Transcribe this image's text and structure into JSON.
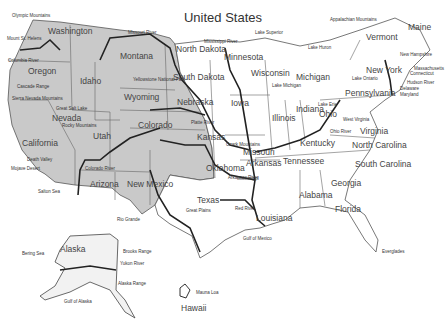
{
  "title": "United States",
  "colors": {
    "west_fill": "#c9c9c9",
    "east_fill": "#ffffff",
    "border": "#555555",
    "river": "#222222"
  },
  "states": [
    {
      "name": "Washington",
      "x": 48,
      "y": 34
    },
    {
      "name": "Oregon",
      "x": 28,
      "y": 74
    },
    {
      "name": "Idaho",
      "x": 80,
      "y": 84
    },
    {
      "name": "Montana",
      "x": 120,
      "y": 59
    },
    {
      "name": "Wyoming",
      "x": 124,
      "y": 100
    },
    {
      "name": "California",
      "x": 22,
      "y": 146
    },
    {
      "name": "Nevada",
      "x": 52,
      "y": 121
    },
    {
      "name": "Utah",
      "x": 93,
      "y": 139
    },
    {
      "name": "Colorado",
      "x": 138,
      "y": 128
    },
    {
      "name": "Arizona",
      "x": 90,
      "y": 187
    },
    {
      "name": "New Mexico",
      "x": 127,
      "y": 187
    },
    {
      "name": "North Dakota",
      "x": 176,
      "y": 52
    },
    {
      "name": "South Dakota",
      "x": 173,
      "y": 80
    },
    {
      "name": "Nebraska",
      "x": 177,
      "y": 105
    },
    {
      "name": "Kansas",
      "x": 197,
      "y": 140
    },
    {
      "name": "Oklahoma",
      "x": 206,
      "y": 171
    },
    {
      "name": "Texas",
      "x": 197,
      "y": 203
    },
    {
      "name": "Minnesota",
      "x": 224,
      "y": 60
    },
    {
      "name": "Iowa",
      "x": 231,
      "y": 106
    },
    {
      "name": "Missouri",
      "x": 243,
      "y": 155
    },
    {
      "name": "Arkansas",
      "x": 246,
      "y": 166
    },
    {
      "name": "Louisiana",
      "x": 256,
      "y": 221
    },
    {
      "name": "Wisconsin",
      "x": 251,
      "y": 76
    },
    {
      "name": "Illinois",
      "x": 272,
      "y": 121
    },
    {
      "name": "Michigan",
      "x": 296,
      "y": 80
    },
    {
      "name": "Indiana",
      "x": 296,
      "y": 112
    },
    {
      "name": "Ohio",
      "x": 319,
      "y": 117
    },
    {
      "name": "Kentucky",
      "x": 300,
      "y": 146
    },
    {
      "name": "Tennessee",
      "x": 283,
      "y": 164
    },
    {
      "name": "Alabama",
      "x": 299,
      "y": 198
    },
    {
      "name": "Georgia",
      "x": 331,
      "y": 186
    },
    {
      "name": "Florida",
      "x": 335,
      "y": 212
    },
    {
      "name": "South Carolina",
      "x": 355,
      "y": 167
    },
    {
      "name": "North Carolina",
      "x": 352,
      "y": 148
    },
    {
      "name": "Virginia",
      "x": 360,
      "y": 134
    },
    {
      "name": "Pennsylvania",
      "x": 345,
      "y": 96
    },
    {
      "name": "New York",
      "x": 366,
      "y": 73
    },
    {
      "name": "Vermont",
      "x": 366,
      "y": 40
    },
    {
      "name": "Maine",
      "x": 408,
      "y": 30
    },
    {
      "name": "Alaska",
      "x": 60,
      "y": 252
    },
    {
      "name": "Hawaii",
      "x": 181,
      "y": 311
    }
  ],
  "features": [
    {
      "name": "Olympic Mountains",
      "x": 12,
      "y": 17
    },
    {
      "name": "Mount St. Helens",
      "x": 7,
      "y": 40
    },
    {
      "name": "Columbia River",
      "x": 8,
      "y": 62
    },
    {
      "name": "Cascade Range",
      "x": 17,
      "y": 88
    },
    {
      "name": "Sierra Nevada Mountains",
      "x": 12,
      "y": 100
    },
    {
      "name": "Great Salt Lake",
      "x": 56,
      "y": 110
    },
    {
      "name": "Rocky Mountains",
      "x": 62,
      "y": 127
    },
    {
      "name": "Death Valley",
      "x": 27,
      "y": 161
    },
    {
      "name": "Mojave Desert",
      "x": 11,
      "y": 170
    },
    {
      "name": "Colorado River",
      "x": 85,
      "y": 170
    },
    {
      "name": "Salton Sea",
      "x": 38,
      "y": 193
    },
    {
      "name": "Missouri River",
      "x": 128,
      "y": 34
    },
    {
      "name": "Yellowstone National Park",
      "x": 133,
      "y": 81
    },
    {
      "name": "Platte River",
      "x": 191,
      "y": 124
    },
    {
      "name": "Ozark Mountains",
      "x": 226,
      "y": 146
    },
    {
      "name": "Arkansas River",
      "x": 228,
      "y": 179
    },
    {
      "name": "Rio Grande",
      "x": 117,
      "y": 221
    },
    {
      "name": "Great Plains",
      "x": 186,
      "y": 212
    },
    {
      "name": "Red River",
      "x": 235,
      "y": 210
    },
    {
      "name": "Gulf of Mexico",
      "x": 243,
      "y": 240
    },
    {
      "name": "Mississippi River",
      "x": 204,
      "y": 43
    },
    {
      "name": "Lake Superior",
      "x": 255,
      "y": 34
    },
    {
      "name": "Lake Huron",
      "x": 308,
      "y": 49
    },
    {
      "name": "Lake Michigan",
      "x": 272,
      "y": 87
    },
    {
      "name": "Lake Erie",
      "x": 318,
      "y": 106
    },
    {
      "name": "Lake Ontario",
      "x": 352,
      "y": 80
    },
    {
      "name": "Ohio River",
      "x": 330,
      "y": 133
    },
    {
      "name": "Mississippi",
      "x": 237,
      "y": 180
    },
    {
      "name": "Appalachian Mountains",
      "x": 330,
      "y": 21
    },
    {
      "name": "New Hampshire",
      "x": 400,
      "y": 56
    },
    {
      "name": "Massachusetts",
      "x": 414,
      "y": 70
    },
    {
      "name": "Connecticut",
      "x": 410,
      "y": 75
    },
    {
      "name": "Hudson River",
      "x": 407,
      "y": 84
    },
    {
      "name": "Delaware",
      "x": 400,
      "y": 90
    },
    {
      "name": "Maryland",
      "x": 400,
      "y": 96
    },
    {
      "name": "West Virginia",
      "x": 343,
      "y": 121
    },
    {
      "name": "Everglades",
      "x": 382,
      "y": 253
    },
    {
      "name": "Bering Sea",
      "x": 22,
      "y": 255
    },
    {
      "name": "Brooks Range",
      "x": 123,
      "y": 253
    },
    {
      "name": "Yukon River",
      "x": 120,
      "y": 265
    },
    {
      "name": "Alaska Range",
      "x": 118,
      "y": 285
    },
    {
      "name": "Gulf of Alaska",
      "x": 64,
      "y": 303
    },
    {
      "name": "Mauna Loa",
      "x": 196,
      "y": 294
    }
  ]
}
